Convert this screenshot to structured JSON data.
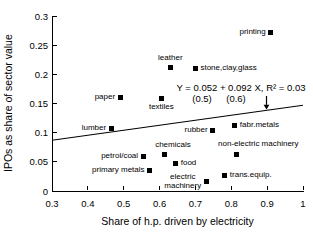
{
  "figure": {
    "background": "#ffffff",
    "foreground": "#000000"
  },
  "chart_data": {
    "type": "scatter",
    "title": "",
    "xlabel": "Share of h.p. driven by electricity",
    "ylabel": "IPOs as share of sector value",
    "xlim": [
      0.3,
      1
    ],
    "ylim": [
      0,
      0.3
    ],
    "grid": false,
    "legend": "none",
    "marker": {
      "shape": "filled-square",
      "color": "#000000",
      "size_px": 5
    },
    "xticks": {
      "values": [
        0.3,
        0.4,
        0.5,
        0.6,
        0.7,
        0.8,
        0.9,
        1
      ],
      "labels": [
        "0.3",
        "0.4",
        "0.5",
        "0.6",
        "0.7",
        "0.8",
        "0.9",
        "1"
      ]
    },
    "yticks": {
      "values": [
        0,
        0.05,
        0.1,
        0.15,
        0.2,
        0.25,
        0.3
      ],
      "labels": [
        "0",
        "0.05",
        "0.1",
        "0.15",
        "0.2",
        "0.25",
        "0.3"
      ]
    },
    "points": [
      {
        "label": "printing",
        "x": 0.91,
        "y": 0.272,
        "label_pos": "left"
      },
      {
        "label": "leather",
        "x": 0.63,
        "y": 0.211,
        "label_pos": "above"
      },
      {
        "label": "stone,clay,glass",
        "x": 0.7,
        "y": 0.21,
        "label_pos": "right"
      },
      {
        "label": "paper",
        "x": 0.49,
        "y": 0.161,
        "label_pos": "left"
      },
      {
        "label": "textiles",
        "x": 0.605,
        "y": 0.158,
        "label_pos": "below"
      },
      {
        "label": "lumber",
        "x": 0.465,
        "y": 0.107,
        "label_pos": "left"
      },
      {
        "label": "rubber",
        "x": 0.748,
        "y": 0.104,
        "label_pos": "left"
      },
      {
        "label": "fabr.metals",
        "x": 0.81,
        "y": 0.113,
        "label_pos": "right"
      },
      {
        "label": "chemicals",
        "x": 0.615,
        "y": 0.062,
        "label_pos": "above",
        "dx": 8
      },
      {
        "label": "petrol/coal",
        "x": 0.554,
        "y": 0.06,
        "label_pos": "left"
      },
      {
        "label": "food",
        "x": 0.645,
        "y": 0.048,
        "label_pos": "right"
      },
      {
        "label": "primary metals",
        "x": 0.572,
        "y": 0.036,
        "label_pos": "left"
      },
      {
        "label": "non-electric machinery",
        "x": 0.814,
        "y": 0.063,
        "label_pos": "above",
        "dx": 22
      },
      {
        "label": "trans.equip.",
        "x": 0.782,
        "y": 0.027,
        "label_pos": "right"
      },
      {
        "label": "electric\nmachinery",
        "x": 0.73,
        "y": 0.017,
        "label_pos": "left"
      }
    ],
    "regression": {
      "equation": "Y = 0.052 + 0.092 X, R² = 0.03",
      "se_intercept": "(0.5)",
      "se_slope": "(0.6)",
      "line_endpoints": [
        {
          "x": 0.3,
          "y": 0.087
        },
        {
          "x": 1.0,
          "y": 0.147
        }
      ]
    }
  }
}
